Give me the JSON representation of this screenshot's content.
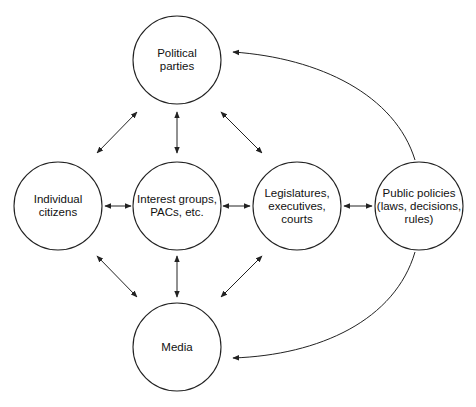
{
  "diagram": {
    "type": "flow-network",
    "colors": {
      "stroke": "#222222",
      "text": "#111111",
      "background": "#ffffff"
    },
    "nodes": [
      {
        "id": "parties",
        "label": "Political\nparties",
        "cx": 177,
        "cy": 60,
        "r": 44
      },
      {
        "id": "citizens",
        "label": "Individual\ncitizens",
        "cx": 58,
        "cy": 206,
        "r": 44
      },
      {
        "id": "groups",
        "label": "Interest groups,\nPACs, etc.",
        "cx": 177,
        "cy": 206,
        "r": 44
      },
      {
        "id": "legislatures",
        "label": "Legislatures,\nexecutives,\ncourts",
        "cx": 297,
        "cy": 206,
        "r": 44
      },
      {
        "id": "policies",
        "label": "Public policies\n(laws, decisions,\nrules)",
        "cx": 419,
        "cy": 206,
        "r": 44
      },
      {
        "id": "media",
        "label": "Media",
        "cx": 177,
        "cy": 347,
        "r": 44
      }
    ],
    "edges": [
      {
        "from": "citizens",
        "to": "parties",
        "bidirectional": true
      },
      {
        "from": "groups",
        "to": "parties",
        "bidirectional": true
      },
      {
        "from": "legislatures",
        "to": "parties",
        "bidirectional": true
      },
      {
        "from": "citizens",
        "to": "groups",
        "bidirectional": true
      },
      {
        "from": "groups",
        "to": "legislatures",
        "bidirectional": true
      },
      {
        "from": "legislatures",
        "to": "policies",
        "bidirectional": true
      },
      {
        "from": "citizens",
        "to": "media",
        "bidirectional": true
      },
      {
        "from": "groups",
        "to": "media",
        "bidirectional": true
      },
      {
        "from": "legislatures",
        "to": "media",
        "bidirectional": true
      },
      {
        "from": "policies",
        "to": "parties",
        "bidirectional": false,
        "curved": true
      },
      {
        "from": "policies",
        "to": "media",
        "bidirectional": false,
        "curved": true
      }
    ]
  }
}
